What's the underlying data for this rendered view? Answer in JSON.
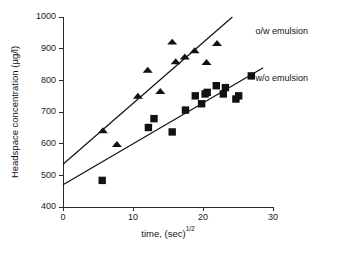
{
  "chart_data": {
    "type": "scatter",
    "title": "",
    "xlabel": "time, (sec)",
    "xlabel_exponent": "1/2",
    "ylabel": "Headspace concentration (µg/l)",
    "xlim": [
      0,
      30
    ],
    "ylim": [
      400,
      1000
    ],
    "xticks": [
      0,
      10,
      20,
      30
    ],
    "yticks": [
      400,
      500,
      600,
      700,
      800,
      900,
      1000
    ],
    "xtick_labels": [
      "0",
      "10",
      "20",
      "30"
    ],
    "ytick_labels": [
      "400",
      "500",
      "600",
      "700",
      "800",
      "900",
      "1000"
    ],
    "grid": false,
    "legend_position": "inline-annotation",
    "series": [
      {
        "name": "o/w emulsion",
        "marker": "triangle",
        "color": "#111111",
        "annotation": "o/w emulsion",
        "annotation_x": 27.5,
        "annotation_y": 955,
        "points": [
          {
            "x": 5.7,
            "y": 641
          },
          {
            "x": 7.7,
            "y": 598
          },
          {
            "x": 10.7,
            "y": 750
          },
          {
            "x": 12.1,
            "y": 832
          },
          {
            "x": 13.9,
            "y": 765
          },
          {
            "x": 15.6,
            "y": 921
          },
          {
            "x": 16.1,
            "y": 859
          },
          {
            "x": 17.4,
            "y": 874
          },
          {
            "x": 18.8,
            "y": 894
          },
          {
            "x": 20.5,
            "y": 857
          },
          {
            "x": 22.0,
            "y": 917
          }
        ],
        "fit_line": {
          "x0": 0,
          "y0": 535,
          "x1": 24.2,
          "y1": 1000
        }
      },
      {
        "name": "w/o emulsion",
        "marker": "square",
        "color": "#111111",
        "annotation": "w/o emulsion",
        "annotation_x": 27.5,
        "annotation_y": 805,
        "points": [
          {
            "x": 5.6,
            "y": 484
          },
          {
            "x": 12.2,
            "y": 651
          },
          {
            "x": 13.0,
            "y": 679
          },
          {
            "x": 15.6,
            "y": 637
          },
          {
            "x": 17.5,
            "y": 706
          },
          {
            "x": 18.9,
            "y": 751
          },
          {
            "x": 19.8,
            "y": 726
          },
          {
            "x": 20.3,
            "y": 757
          },
          {
            "x": 20.6,
            "y": 762
          },
          {
            "x": 21.9,
            "y": 783
          },
          {
            "x": 22.9,
            "y": 757
          },
          {
            "x": 23.2,
            "y": 777
          },
          {
            "x": 24.7,
            "y": 741
          },
          {
            "x": 25.1,
            "y": 751
          },
          {
            "x": 26.9,
            "y": 814
          }
        ],
        "fit_line": {
          "x0": 0,
          "y0": 470,
          "x1": 28.6,
          "y1": 840
        }
      }
    ]
  }
}
